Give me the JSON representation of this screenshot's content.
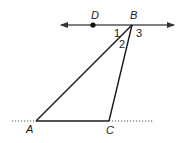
{
  "diagram": {
    "type": "geometry",
    "colors": {
      "stroke": "#1a1a1a",
      "line_through_b": "#555555",
      "dotted": "#555555"
    },
    "points": {
      "A": {
        "label": "A",
        "x": 36,
        "y": 121
      },
      "B": {
        "label": "B",
        "x": 132,
        "y": 25
      },
      "C": {
        "label": "C",
        "x": 109,
        "y": 121
      },
      "D": {
        "label": "D",
        "x": 93,
        "y": 25
      }
    },
    "angles": [
      {
        "label": "1"
      },
      {
        "label": "2"
      },
      {
        "label": "3"
      }
    ],
    "segments": [
      "AB",
      "BC",
      "AC"
    ],
    "line": {
      "through": [
        "D",
        "B"
      ],
      "arrows": "both"
    },
    "dotted_line": {
      "through": [
        "A",
        "C"
      ]
    }
  }
}
